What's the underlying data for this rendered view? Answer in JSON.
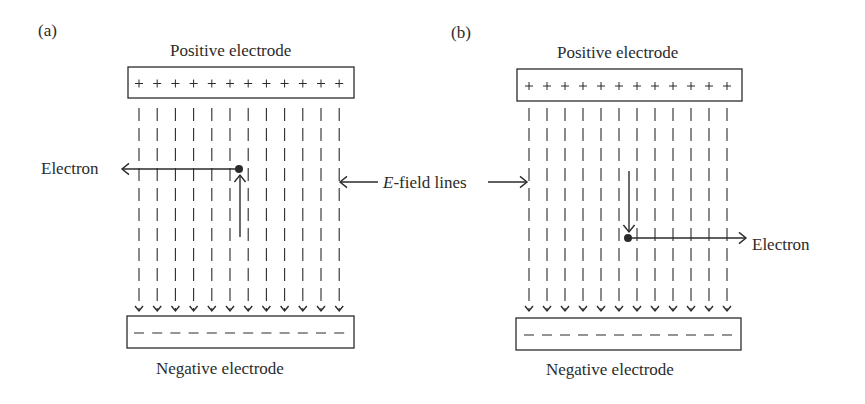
{
  "panels": [
    {
      "id": "a",
      "tag": "(a)",
      "positive_label": "Positive electrode",
      "negative_label": "Negative electrode",
      "positive_box": {
        "x": 128,
        "y": 67,
        "w": 226,
        "h": 31
      },
      "negative_box": {
        "x": 127,
        "y": 316,
        "w": 227,
        "h": 32
      },
      "field_x_start": 139,
      "field_spacing": 18.2,
      "field_count": 12,
      "field_y_top": 108,
      "field_y_bottom": 306,
      "electron": {
        "label": "Electron",
        "dot": {
          "x": 239,
          "y": 169
        },
        "motion_arrow": {
          "x": 240,
          "y1": 237,
          "y2": 175,
          "direction": "up"
        },
        "force_arrow": {
          "y": 169,
          "x1": 239,
          "x2": 122,
          "direction": "left"
        }
      }
    },
    {
      "id": "b",
      "tag": "(b)",
      "positive_label": "Positive electrode",
      "negative_label": "Negative electrode",
      "positive_box": {
        "x": 517,
        "y": 69,
        "w": 225,
        "h": 32
      },
      "negative_box": {
        "x": 516,
        "y": 318,
        "w": 225,
        "h": 32
      },
      "field_x_start": 529,
      "field_spacing": 18.0,
      "field_count": 12,
      "field_y_top": 108,
      "field_y_bottom": 306,
      "electron": {
        "label": "Electron",
        "dot": {
          "x": 628,
          "y": 238
        },
        "motion_arrow": {
          "x": 629,
          "y1": 171,
          "y2": 232,
          "direction": "down"
        },
        "force_arrow": {
          "y": 238,
          "x1": 628,
          "x2": 746,
          "direction": "right"
        }
      }
    }
  ],
  "field_lines_label": {
    "italic_part": "E",
    "rest": "-field lines",
    "left_arrow_tip_x": 340,
    "right_arrow_tip_x": 527,
    "y": 182
  },
  "colors": {
    "ink": "#2b2b2b",
    "background": "#ffffff"
  }
}
